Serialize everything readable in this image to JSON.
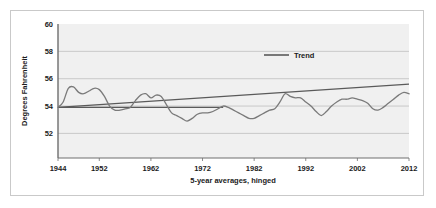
{
  "chart_data": {
    "type": "line",
    "title": "",
    "xlabel": "5-year averages, hinged",
    "ylabel": "Degrees Fahrenheit",
    "xlim": [
      1944,
      2012
    ],
    "ylim": [
      50.2,
      60
    ],
    "grid": true,
    "legend_position": "top-right",
    "xticks": [
      "1944",
      "1952",
      "1962",
      "1972",
      "1982",
      "1992",
      "2002",
      "2012"
    ],
    "xtick_values": [
      1944,
      1952,
      1962,
      1972,
      1982,
      1992,
      2002,
      2012
    ],
    "yticks": [
      "52",
      "54",
      "56",
      "58",
      "60"
    ],
    "ytick_values": [
      52,
      54,
      56,
      58,
      60
    ],
    "series": [
      {
        "name": "5-year average temperature",
        "color": "#7a7a7a",
        "x": [
          1944,
          1945,
          1946,
          1947,
          1948,
          1949,
          1950,
          1951,
          1952,
          1953,
          1954,
          1955,
          1956,
          1957,
          1958,
          1959,
          1960,
          1961,
          1962,
          1963,
          1964,
          1965,
          1966,
          1967,
          1968,
          1969,
          1970,
          1971,
          1972,
          1973,
          1974,
          1975,
          1976,
          1977,
          1978,
          1979,
          1980,
          1981,
          1982,
          1983,
          1984,
          1985,
          1986,
          1987,
          1988,
          1989,
          1990,
          1991,
          1992,
          1993,
          1994,
          1995,
          1996,
          1997,
          1998,
          1999,
          2000,
          2001,
          2002,
          2003,
          2004,
          2005,
          2006,
          2007,
          2008,
          2009,
          2010,
          2011,
          2012
        ],
        "values": [
          53.9,
          54.3,
          55.3,
          55.4,
          55.0,
          54.9,
          55.1,
          55.3,
          55.2,
          54.7,
          54.0,
          53.7,
          53.7,
          53.8,
          53.9,
          54.4,
          54.8,
          54.9,
          54.6,
          54.8,
          54.7,
          54.1,
          53.5,
          53.3,
          53.1,
          52.9,
          53.1,
          53.4,
          53.5,
          53.5,
          53.6,
          53.8,
          54.0,
          53.9,
          53.7,
          53.5,
          53.3,
          53.1,
          53.1,
          53.3,
          53.5,
          53.7,
          53.8,
          54.3,
          54.9,
          54.7,
          54.6,
          54.6,
          54.3,
          54.0,
          53.6,
          53.3,
          53.6,
          54.0,
          54.3,
          54.5,
          54.5,
          54.6,
          54.5,
          54.4,
          54.2,
          53.8,
          53.7,
          53.9,
          54.2,
          54.5,
          54.8,
          55.0,
          54.9
        ]
      },
      {
        "name": "Trend",
        "color": "#5a5a5a",
        "type": "linear-trend",
        "x": [
          1944,
          2012
        ],
        "values": [
          53.9,
          55.6
        ]
      }
    ],
    "reference_line": {
      "name": "baseline",
      "value": 53.9,
      "x_start": 1944,
      "x_end": 1976,
      "color": "#5a5a5a"
    },
    "annotations": []
  },
  "legend": {
    "entries": [
      {
        "label": "Trend",
        "color": "#5a5a5a"
      }
    ]
  },
  "colors": {
    "plot_background": "#f0f0f0",
    "gridline": "#b8b8b8",
    "axis": "#6e6e6e",
    "series": "#7a7a7a",
    "trend": "#5a5a5a",
    "frame_border": "#c9c9c9",
    "text": "#1b1b1b"
  }
}
